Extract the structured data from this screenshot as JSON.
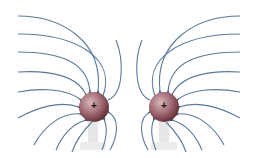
{
  "figure": {
    "charges": [
      {
        "id": "left",
        "sign": "+",
        "cx": 94,
        "cy": 107,
        "r": 15
      },
      {
        "id": "right",
        "sign": "+",
        "cx": 164,
        "cy": 107,
        "r": 15
      }
    ],
    "colors": {
      "field_line": "#4a6a8c",
      "sphere_light": "#c8a0a8",
      "sphere_dark": "#6e3840",
      "stand": "#e4e4e4",
      "background": "#ffffff"
    }
  }
}
